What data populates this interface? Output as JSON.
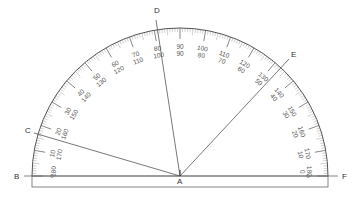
{
  "diagram": {
    "points": {
      "A": "A",
      "B": "B",
      "C": "C",
      "D": "D",
      "E": "E",
      "F": "F"
    },
    "protractor": {
      "center": [
        180,
        176
      ],
      "outer_radius": 148,
      "outer_scale_labels": [
        "10",
        "20",
        "30",
        "40",
        "50",
        "60",
        "70",
        "80",
        "90",
        "100",
        "110",
        "120",
        "130",
        "140",
        "150",
        "160",
        "170",
        "180"
      ],
      "inner_scale_labels": [
        "170",
        "160",
        "150",
        "140",
        "130",
        "120",
        "110",
        "100",
        "90",
        "80",
        "70",
        "60",
        "50",
        "40",
        "30",
        "20",
        "10",
        "0"
      ],
      "major_step_deg": 10,
      "minor_step_deg": 1
    },
    "rays": [
      {
        "name": "ray-AB",
        "to": "B",
        "angle_deg": 180
      },
      {
        "name": "ray-AC",
        "to": "C",
        "angle_deg": 164
      },
      {
        "name": "ray-AD",
        "to": "D",
        "angle_deg": 98
      },
      {
        "name": "ray-AE",
        "to": "E",
        "angle_deg": 47
      },
      {
        "name": "ray-AF",
        "to": "F",
        "angle_deg": 0
      }
    ],
    "colors": {
      "line": "#555555",
      "ticks": "#777777",
      "text": "#444444",
      "background": "#ffffff"
    }
  }
}
